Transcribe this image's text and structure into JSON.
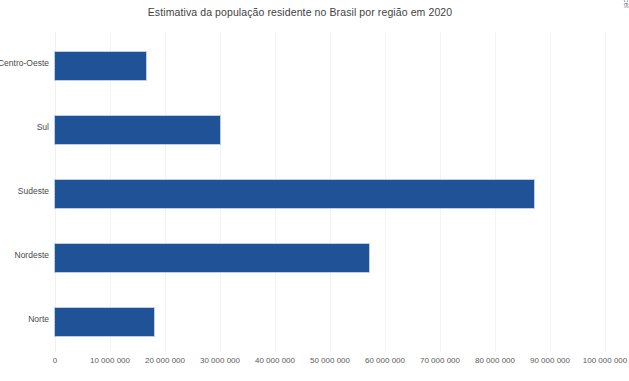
{
  "chart_data": {
    "type": "bar",
    "orientation": "horizontal",
    "title": "Estimativa da população residente no Brasil por região em 2020",
    "xlabel": "",
    "ylabel": "",
    "categories": [
      "Norte",
      "Nordeste",
      "Sudeste",
      "Sul",
      "Centro-Oeste"
    ],
    "values": [
      18000000,
      57000000,
      87000000,
      30000000,
      16500000
    ],
    "xlim": [
      0,
      100000000
    ],
    "xticks": [
      0,
      10000000,
      20000000,
      30000000,
      40000000,
      50000000,
      60000000,
      70000000,
      80000000,
      90000000,
      100000000
    ],
    "xtick_labels": [
      "0",
      "10 000 000",
      "20 000 000",
      "30 000 000",
      "40 000 000",
      "50 000 000",
      "60 000 000",
      "70 000 000",
      "80 000 000",
      "90 000 000",
      "100 000 000"
    ],
    "grid": true,
    "legend": false,
    "bar_color": "#1F5297",
    "gridline_color": "#F4F4F4"
  },
  "credit": {
    "text": "Reprodução/Microsoft Excel"
  },
  "bottom_caption": {
    "text": ""
  }
}
